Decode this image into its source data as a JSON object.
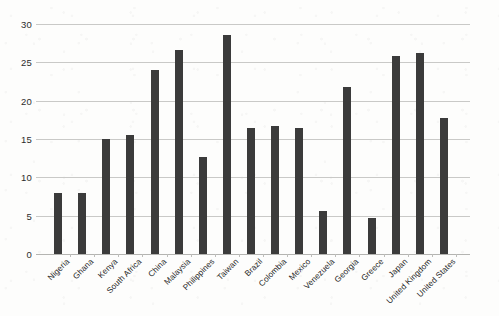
{
  "chart_data": {
    "type": "bar",
    "title": "",
    "subtitle": "",
    "xlabel": "",
    "ylabel": "",
    "ylim": [
      0,
      30
    ],
    "y_ticks": [
      0,
      5,
      10,
      15,
      20,
      25,
      30
    ],
    "y_tick_labels": [
      "0",
      "5",
      "10",
      "15",
      "20",
      "25",
      "30"
    ],
    "grid": true,
    "legend": false,
    "legend_position": "none",
    "bar_color": "#3b3b3b",
    "gridline_color": "#c9c9c7",
    "background_color": "#fdfdfc",
    "x_label_rotation_deg": -45,
    "categories": [
      "Nigeria",
      "Ghana",
      "Kenya",
      "South Africa",
      "China",
      "Malaysia",
      "Philippines",
      "Taiwan",
      "Brazil",
      "Colombia",
      "Mexico",
      "Venezuela",
      "Georgia",
      "Greece",
      "Japan",
      "United Kingdom",
      "United States"
    ],
    "values": [
      8.0,
      8.0,
      15.0,
      15.5,
      24.0,
      26.6,
      12.6,
      28.6,
      16.4,
      16.7,
      16.5,
      5.6,
      21.8,
      4.7,
      25.8,
      26.2,
      17.7
    ]
  }
}
